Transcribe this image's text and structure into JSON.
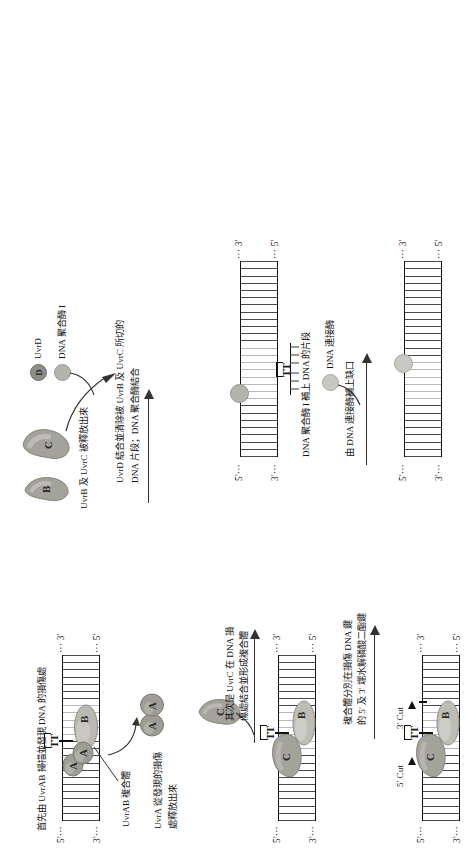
{
  "figure": {
    "title_domain": "DNA nucleotide excision repair pathway",
    "language": "zh-Hant"
  },
  "labels": {
    "five_prime": "5'···",
    "three_prime": "3'···",
    "five_prime_end": "··· 5'",
    "three_prime_end": "··· 3'",
    "dimer": "TT",
    "cut5": "5' Cut",
    "cut3": "3' Cut"
  },
  "proteins": {
    "a": "A",
    "b": "B",
    "c": "C",
    "d": "D"
  },
  "panels": {
    "p1": {
      "caption": "首先由 UvrAB 掃描並發現 DNA 的損傷處",
      "complex_label": "UvrAB 複合體",
      "release_label_l1": "UvrA 從發現的損傷",
      "release_label_l2": "處釋放出來"
    },
    "step1to2": {
      "l1": "其次是 UvrC 在 DNA 損",
      "l2": "傷處結合並形成複合體"
    },
    "step2to3": {
      "l1": "複合體分別在損傷 DNA 鍵",
      "l2": "的 5' 及 3' 端水解磷酸二酯鍵"
    },
    "step3to4": {
      "legend_d": "UvrD",
      "legend_pol": "DNA 聚合酶 I",
      "l1": "UvrD 結合並清除被 UvrB 及 UvrC 所切的",
      "l2": "DNA 片段；DNA 聚合酶結合",
      "release": "UvrB 及 UvrC 被釋放出來"
    },
    "step4to5": {
      "l1": "DNA 聚合酶 I 補上 DNA 的片段",
      "legend_ligase": "DNA 連接酶",
      "l2": "由 DNA 連接酶補上缺口"
    }
  },
  "colors": {
    "strand": "#111111",
    "rung": "#4a4a4a",
    "rung_light": "#b9b9b9",
    "protein_fill": "#9a9a94",
    "protein_fill_light": "#cfcfc9",
    "uvrd_fill": "#8e8e88",
    "pol_fill": "#b4b4ae",
    "ligase_fill": "#c8c8c2",
    "arrow": "#333333",
    "text": "#111111"
  }
}
